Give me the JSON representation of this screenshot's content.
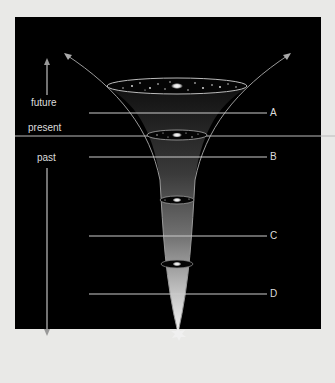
{
  "diagram": {
    "time_labels": {
      "future": "future",
      "present": "present",
      "past": "past"
    },
    "markers": [
      {
        "id": "A",
        "label": "A"
      },
      {
        "id": "B",
        "label": "B"
      },
      {
        "id": "C",
        "label": "C"
      },
      {
        "id": "D",
        "label": "D"
      }
    ],
    "colors": {
      "background": "#000000",
      "page": "#e9e9e7",
      "line": "#cfcfcf",
      "funnel_glow": "#f2f2f2"
    }
  }
}
